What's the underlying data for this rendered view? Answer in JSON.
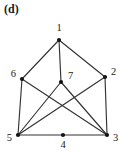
{
  "figure": {
    "panel_label": "(d)",
    "caption_position": "top-left"
  },
  "graph": {
    "node_radius": 2.1,
    "edge_color": "#333333",
    "node_color": "#141414",
    "label_color": "#1a1a1a",
    "vertices": [
      {
        "id": "1",
        "label": "1",
        "x": 59,
        "y": 40,
        "label_x": 59,
        "label_y": 31,
        "label_anchor": "middle"
      },
      {
        "id": "2",
        "label": "2",
        "x": 105,
        "y": 77,
        "label_x": 111,
        "label_y": 75,
        "label_anchor": "start"
      },
      {
        "id": "3",
        "label": "3",
        "x": 107,
        "y": 135,
        "label_x": 113,
        "label_y": 141,
        "label_anchor": "start"
      },
      {
        "id": "4",
        "label": "4",
        "x": 63,
        "y": 135,
        "label_x": 63,
        "label_y": 148,
        "label_anchor": "middle"
      },
      {
        "id": "5",
        "label": "5",
        "x": 18,
        "y": 135,
        "label_x": 12,
        "label_y": 141,
        "label_anchor": "end"
      },
      {
        "id": "6",
        "label": "6",
        "x": 22,
        "y": 79,
        "label_x": 16,
        "label_y": 77,
        "label_anchor": "end"
      },
      {
        "id": "7",
        "label": "7",
        "x": 61,
        "y": 82,
        "label_x": 68,
        "label_y": 79,
        "label_anchor": "start"
      }
    ],
    "edges": [
      {
        "from": "1",
        "to": "6"
      },
      {
        "from": "1",
        "to": "2"
      },
      {
        "from": "1",
        "to": "7"
      },
      {
        "from": "6",
        "to": "5"
      },
      {
        "from": "6",
        "to": "3"
      },
      {
        "from": "2",
        "to": "3"
      },
      {
        "from": "2",
        "to": "5"
      },
      {
        "from": "5",
        "to": "4"
      },
      {
        "from": "4",
        "to": "3"
      },
      {
        "from": "5",
        "to": "7"
      },
      {
        "from": "7",
        "to": "3"
      }
    ]
  }
}
